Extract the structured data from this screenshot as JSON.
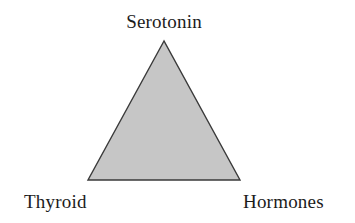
{
  "figure": {
    "type": "triangle-diagram",
    "background_color": "#ffffff",
    "caption": ""
  },
  "diagram": {
    "shape_name": "triangle",
    "fill_color": "#c6c6c6",
    "stroke_color": "#3a3a3a",
    "stroke_width": 1.4,
    "vertices": [
      {
        "id": "apex",
        "x": 164,
        "y": 41,
        "label": "Serotonin"
      },
      {
        "id": "bottom-left",
        "x": 88,
        "y": 180,
        "label": "Thyroid"
      },
      {
        "id": "bottom-right",
        "x": 240,
        "y": 180,
        "label": "Hormones"
      }
    ],
    "labels": {
      "top": "Serotonin",
      "bottom_left": "Thyroid",
      "bottom_right": "Hormones"
    },
    "label_color": "#1c1c1c"
  }
}
